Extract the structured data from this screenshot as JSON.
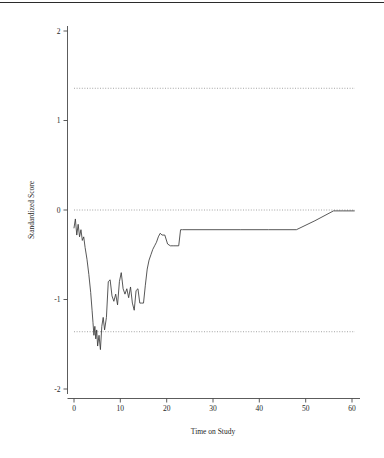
{
  "figure": {
    "title": "",
    "top_rule": true
  },
  "chart_data": {
    "type": "line",
    "title": "",
    "subtitle": "",
    "xlabel": "Time on Study",
    "ylabel": "Standardized Score",
    "xlim": [
      -1.5,
      62
    ],
    "ylim": [
      -2.15,
      2.2
    ],
    "xticks": [
      0,
      10,
      20,
      30,
      40,
      50,
      60
    ],
    "xtick_labels": [
      "0",
      "10",
      "20",
      "30",
      "40",
      "50",
      "60"
    ],
    "yticks": [
      2,
      1,
      0,
      -1,
      -2
    ],
    "ytick_labels": [
      "2",
      "1",
      "0",
      "-1",
      "-2"
    ],
    "grid": false,
    "legend": null,
    "legend_position": "none",
    "line_color": "#3a3a3a",
    "reference_line_color": "#8d8d8d",
    "reference_lines": [
      {
        "name": "upper-control-limit",
        "y": 1.36,
        "style": "dotted"
      },
      {
        "name": "center-line",
        "y": 0.0,
        "style": "dotted"
      },
      {
        "name": "lower-control-limit",
        "y": -1.36,
        "style": "dotted"
      }
    ],
    "series": [
      {
        "name": "standardized-score",
        "x": [
          0.0,
          0.3,
          0.6,
          0.9,
          1.2,
          1.5,
          1.8,
          2.1,
          2.4,
          2.8,
          3.2,
          3.6,
          3.9,
          4.1,
          4.3,
          4.5,
          4.7,
          4.9,
          5.1,
          5.4,
          5.7,
          6.0,
          6.3,
          6.6,
          7.0,
          7.4,
          7.8,
          8.2,
          8.6,
          9.0,
          9.4,
          9.8,
          10.2,
          10.6,
          11.0,
          11.4,
          11.8,
          12.2,
          12.6,
          13.0,
          13.4,
          13.8,
          14.2,
          14.6,
          15.0,
          15.4,
          15.8,
          16.2,
          16.6,
          17.0,
          17.4,
          17.8,
          18.2,
          18.6,
          19.0,
          19.6,
          20.2,
          20.8,
          21.4,
          22.0,
          22.6,
          23.0,
          23.4,
          30.0,
          36.0,
          42.0,
          48.0,
          52.0,
          56.0,
          58.0,
          60.5
        ],
        "y": [
          -0.2,
          -0.1,
          -0.28,
          -0.16,
          -0.3,
          -0.22,
          -0.34,
          -0.3,
          -0.42,
          -0.55,
          -0.72,
          -0.92,
          -1.12,
          -1.26,
          -1.4,
          -1.3,
          -1.44,
          -1.34,
          -1.52,
          -1.4,
          -1.56,
          -1.3,
          -1.2,
          -1.34,
          -1.2,
          -0.8,
          -0.78,
          -0.96,
          -1.02,
          -0.94,
          -1.06,
          -0.8,
          -0.7,
          -0.88,
          -0.94,
          -0.88,
          -0.98,
          -0.86,
          -1.04,
          -1.12,
          -0.9,
          -0.88,
          -1.04,
          -1.04,
          -1.04,
          -0.84,
          -0.66,
          -0.56,
          -0.5,
          -0.44,
          -0.4,
          -0.36,
          -0.3,
          -0.26,
          -0.28,
          -0.28,
          -0.38,
          -0.4,
          -0.4,
          -0.4,
          -0.4,
          -0.22,
          -0.22,
          -0.22,
          -0.22,
          -0.22,
          -0.22,
          -0.12,
          -0.01,
          -0.01,
          -0.01
        ]
      }
    ]
  }
}
